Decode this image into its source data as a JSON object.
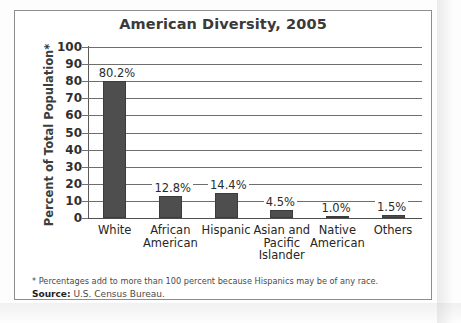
{
  "figure": {
    "title": "American Diversity, 2005",
    "footnote": "* Percentages add to more than 100 percent because Hispanics may be of any race.",
    "source_label": "Source:",
    "source_text": " U.S. Census Bureau."
  },
  "chart_data": {
    "type": "bar",
    "title": "American Diversity, 2005",
    "xlabel": "",
    "ylabel": "Percent of Total Population*",
    "ylim": [
      0,
      100
    ],
    "ytick_step": 10,
    "yticks": [
      100,
      90,
      80,
      70,
      60,
      50,
      40,
      30,
      20,
      10,
      0
    ],
    "ytick_labels": [
      "100",
      "90",
      "80",
      "70",
      "60",
      "50",
      "40",
      "30",
      "20",
      "10",
      "0"
    ],
    "grid": true,
    "legend": "none",
    "bar_color": "#4e4e4e",
    "categories": [
      "White",
      "African American",
      "Hispanic",
      "Asian and Pacific Islander",
      "Native American",
      "Others"
    ],
    "category_lines": [
      [
        "White"
      ],
      [
        "African",
        "American"
      ],
      [
        "Hispanic"
      ],
      [
        "Asian and",
        "Pacific",
        "Islander"
      ],
      [
        "Native",
        "American"
      ],
      [
        "Others"
      ]
    ],
    "values": [
      80.2,
      12.8,
      14.4,
      4.5,
      1.0,
      1.5
    ],
    "value_labels": [
      "80.2%",
      "12.8%",
      "14.4%",
      "4.5%",
      "1.0%",
      "1.5%"
    ]
  }
}
